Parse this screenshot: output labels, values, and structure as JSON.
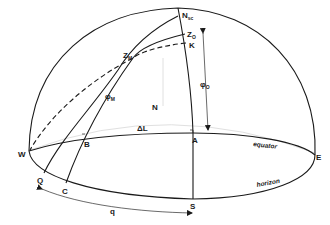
{
  "diagram": {
    "type": "celestial-sphere-hemisphere",
    "colors": {
      "stroke": "#1a1a1a",
      "faint": "#e0e0e0",
      "background": "#ffffff"
    },
    "points": {
      "N_sc": {
        "label": "N",
        "sub": "sc"
      },
      "Z_O": {
        "label": "Z",
        "sub": "O"
      },
      "K": {
        "label": "K"
      },
      "Z_M": {
        "label": "Z",
        "sub": "M"
      },
      "phi_M": {
        "label": "φ",
        "sub": "M"
      },
      "phi_O": {
        "label": "φ",
        "sub": "O"
      },
      "N": {
        "label": "N"
      },
      "delta_L": {
        "label": "ΔL"
      },
      "A": {
        "label": "A"
      },
      "B": {
        "label": "B"
      },
      "W": {
        "label": "W"
      },
      "E": {
        "label": "E"
      },
      "Q": {
        "label": "Q"
      },
      "C": {
        "label": "C"
      },
      "S": {
        "label": "S"
      },
      "q": {
        "label": "q"
      }
    },
    "curve_labels": {
      "equator": "equator",
      "horizon": "horizon"
    }
  }
}
